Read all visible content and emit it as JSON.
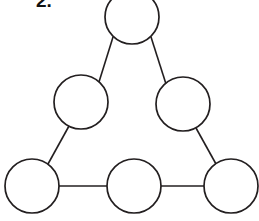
{
  "page": {
    "width": 259,
    "height": 221,
    "background_color": "#ffffff"
  },
  "question": {
    "number_label": "2.",
    "label_color": "#111111",
    "clipped_top": true
  },
  "diagram": {
    "type": "node-link-diagram",
    "stroke_color": "#231f20",
    "node_fill_color": "#ffffff",
    "node_stroke_width": 1.7,
    "edge_stroke_width": 1.6,
    "node_count": 6,
    "edge_count": 6,
    "nodes": [
      {
        "id": "top",
        "label": "",
        "cx": 132,
        "cy": 17,
        "r": 27
      },
      {
        "id": "middle-left",
        "label": "",
        "cx": 81,
        "cy": 102,
        "r": 27
      },
      {
        "id": "middle-right",
        "label": "",
        "cx": 183,
        "cy": 104,
        "r": 27
      },
      {
        "id": "bottom-left",
        "label": "",
        "cx": 32,
        "cy": 186,
        "r": 27
      },
      {
        "id": "bottom-center",
        "label": "",
        "cx": 134,
        "cy": 186,
        "r": 27
      },
      {
        "id": "bottom-right",
        "label": "",
        "cx": 231,
        "cy": 186,
        "r": 27
      }
    ],
    "edges": [
      {
        "id": "edge-top-to-middle-left",
        "from": "top",
        "to": "middle-left",
        "x1": 113,
        "y1": 37,
        "x2": 99,
        "y2": 82
      },
      {
        "id": "edge-top-to-middle-right",
        "from": "top",
        "to": "middle-right",
        "x1": 151,
        "y1": 37,
        "x2": 166,
        "y2": 84
      },
      {
        "id": "edge-middle-left-to-bottom-left",
        "from": "middle-left",
        "to": "bottom-left",
        "x1": 69,
        "y1": 126,
        "x2": 48,
        "y2": 164
      },
      {
        "id": "edge-middle-right-to-bottom-right",
        "from": "middle-right",
        "to": "bottom-right",
        "x1": 196,
        "y1": 128,
        "x2": 216,
        "y2": 164
      },
      {
        "id": "edge-bottom-left-to-bottom-center",
        "from": "bottom-left",
        "to": "bottom-center",
        "x1": 59,
        "y1": 186,
        "x2": 107,
        "y2": 186
      },
      {
        "id": "edge-bottom-center-to-bottom-right",
        "from": "bottom-center",
        "to": "bottom-right",
        "x1": 161,
        "y1": 186,
        "x2": 204,
        "y2": 186
      }
    ]
  }
}
